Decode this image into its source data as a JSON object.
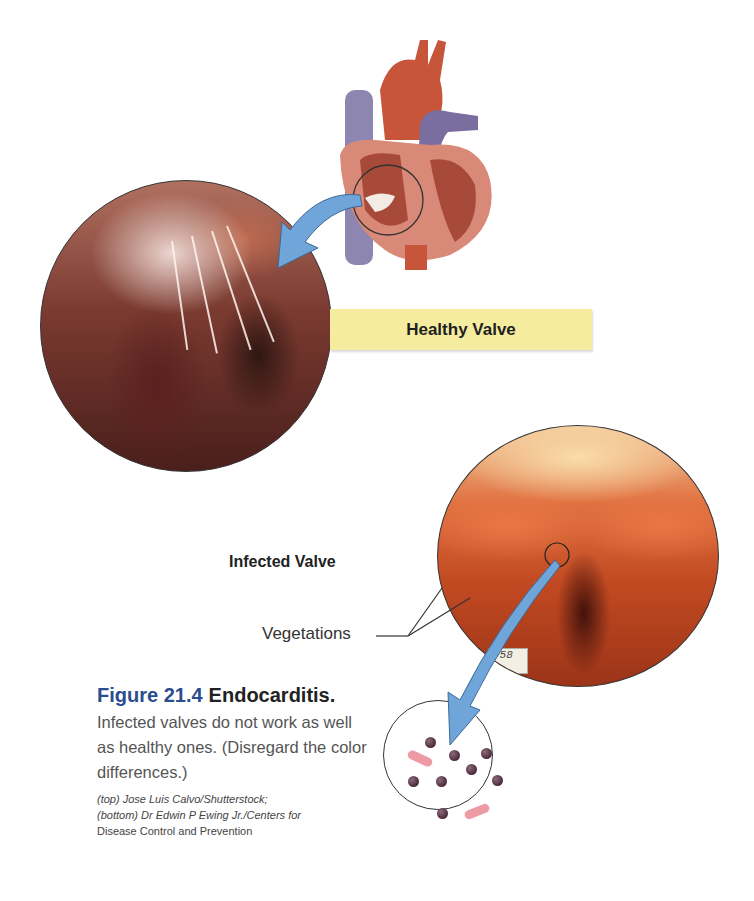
{
  "figure": {
    "number_label": "Figure 21.4",
    "title": "Endocarditis.",
    "body": "Infected valves do not work as well as healthy ones. (Disregard the color differences.)",
    "credits": [
      "(top) Jose Luis Calvo/Shutterstock;",
      "(bottom) Dr Edwin P Ewing Jr./Centers for",
      "Disease Control and Prevention"
    ],
    "transcription_note": "Leading words of each caption line ('Figure', 'Infected', 'well', 'the color', '(top) Jo', '(bottom)') and the final credit line were read from the full-frame overview; zoomed crops verified the remainder of each line."
  },
  "labels": {
    "healthy_valve": "Healthy Valve",
    "infected_valve": "Infected Valve",
    "vegetations": "Vegetations"
  },
  "specimen_tag": "-58",
  "colors": {
    "figure_number": "#2a4d8f",
    "label_box": "#f6ec9f",
    "arrow": "#6fa5d8",
    "caption_body": "#555555",
    "bacteria_cocci": "#4a2a3a",
    "bacteria_rod": "#ee9aa4"
  },
  "images": [
    {
      "name": "heart-illustration",
      "description": "Cutaway illustration of the human heart with a circle highlighting a valve"
    },
    {
      "name": "healthy-valve-photo",
      "description": "Circular photo of a healthy heart valve with chordae tendineae"
    },
    {
      "name": "infected-valve-photo",
      "description": "Circular photo of an infected heart valve with vegetations"
    },
    {
      "name": "bacteria-inset",
      "description": "Magnified inset showing spherical and rod-shaped bacteria"
    }
  ]
}
